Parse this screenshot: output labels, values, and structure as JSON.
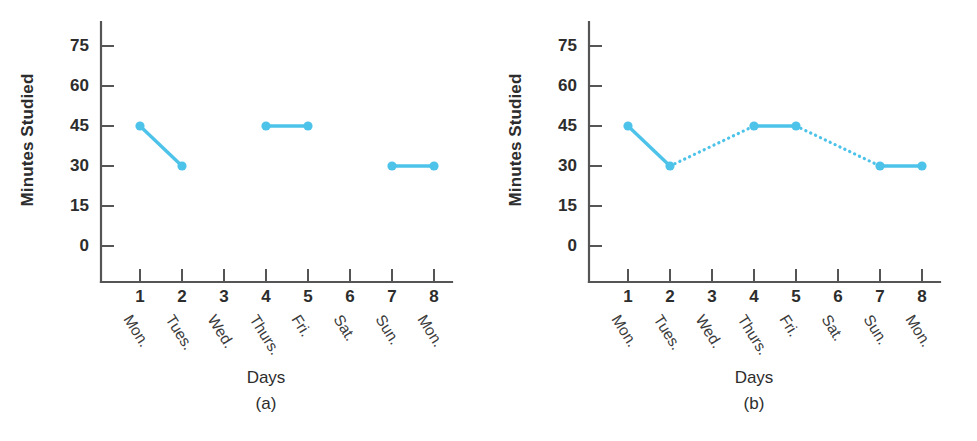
{
  "figure": {
    "panels": [
      {
        "id": "a",
        "caption": "(a)",
        "xlabel": "Days",
        "ylabel": "Minutes Studied"
      },
      {
        "id": "b",
        "caption": "(b)",
        "xlabel": "Days",
        "ylabel": "Minutes Studied"
      }
    ],
    "footer_partial_text": ""
  },
  "colors": {
    "series": "#4ec3ea",
    "marker": "#4ec3ea",
    "axis": "#555555",
    "text": "#2d2d2d"
  },
  "chart_data": [
    {
      "type": "line",
      "title": "(a)",
      "xlabel": "Days",
      "ylabel": "Minutes Studied",
      "xlim": [
        0,
        9
      ],
      "ylim": [
        0,
        80
      ],
      "grid": false,
      "legend": "none",
      "xtick_values": [
        1,
        2,
        3,
        4,
        5,
        6,
        7,
        8
      ],
      "xtick_labels": [
        "1",
        "2",
        "3",
        "4",
        "5",
        "6",
        "7",
        "8"
      ],
      "xcategory_labels": [
        "Mon.",
        "Tues.",
        "Wed.",
        "Thurs.",
        "Fri.",
        "Sat.",
        "Sun.",
        "Mon."
      ],
      "ytick_values": [
        0,
        15,
        30,
        45,
        60,
        75
      ],
      "ytick_labels": [
        "0",
        "15",
        "30",
        "45",
        "60",
        "75"
      ],
      "x": [
        1,
        2,
        4,
        5,
        7,
        8
      ],
      "values": [
        45,
        30,
        45,
        45,
        30,
        30
      ],
      "points": [
        {
          "x": 1,
          "day": "Mon.",
          "y": 45
        },
        {
          "x": 2,
          "day": "Tues.",
          "y": 30
        },
        {
          "x": 4,
          "day": "Thurs.",
          "y": 45
        },
        {
          "x": 5,
          "day": "Fri.",
          "y": 45
        },
        {
          "x": 7,
          "day": "Sun.",
          "y": 30
        },
        {
          "x": 8,
          "day": "Mon.",
          "y": 30
        }
      ],
      "segments": [
        {
          "style": "solid",
          "from": {
            "x": 1,
            "y": 45
          },
          "to": {
            "x": 2,
            "y": 30
          }
        },
        {
          "style": "solid",
          "from": {
            "x": 4,
            "y": 45
          },
          "to": {
            "x": 5,
            "y": 45
          }
        },
        {
          "style": "solid",
          "from": {
            "x": 7,
            "y": 30
          },
          "to": {
            "x": 8,
            "y": 30
          }
        }
      ],
      "missing_x": [
        3,
        6
      ],
      "notes": "Only measured days plotted; gaps left blank at days 3 and 6."
    },
    {
      "type": "line",
      "title": "(b)",
      "xlabel": "Days",
      "ylabel": "Minutes Studied",
      "xlim": [
        0,
        9
      ],
      "ylim": [
        0,
        80
      ],
      "grid": false,
      "legend": "none",
      "xtick_values": [
        1,
        2,
        3,
        4,
        5,
        6,
        7,
        8
      ],
      "xtick_labels": [
        "1",
        "2",
        "3",
        "4",
        "5",
        "6",
        "7",
        "8"
      ],
      "xcategory_labels": [
        "Mon.",
        "Tues.",
        "Wed.",
        "Thurs.",
        "Fri.",
        "Sat.",
        "Sun.",
        "Mon."
      ],
      "ytick_values": [
        0,
        15,
        30,
        45,
        60,
        75
      ],
      "ytick_labels": [
        "0",
        "15",
        "30",
        "45",
        "60",
        "75"
      ],
      "x": [
        1,
        2,
        4,
        5,
        7,
        8
      ],
      "values": [
        45,
        30,
        45,
        45,
        30,
        30
      ],
      "points": [
        {
          "x": 1,
          "day": "Mon.",
          "y": 45
        },
        {
          "x": 2,
          "day": "Tues.",
          "y": 30
        },
        {
          "x": 4,
          "day": "Thurs.",
          "y": 45
        },
        {
          "x": 5,
          "day": "Fri.",
          "y": 45
        },
        {
          "x": 7,
          "day": "Sun.",
          "y": 30
        },
        {
          "x": 8,
          "day": "Mon.",
          "y": 30
        }
      ],
      "segments": [
        {
          "style": "solid",
          "from": {
            "x": 1,
            "y": 45
          },
          "to": {
            "x": 2,
            "y": 30
          }
        },
        {
          "style": "dotted",
          "from": {
            "x": 2,
            "y": 30
          },
          "to": {
            "x": 4,
            "y": 45
          }
        },
        {
          "style": "solid",
          "from": {
            "x": 4,
            "y": 45
          },
          "to": {
            "x": 5,
            "y": 45
          }
        },
        {
          "style": "dotted",
          "from": {
            "x": 5,
            "y": 45
          },
          "to": {
            "x": 7,
            "y": 30
          }
        },
        {
          "style": "solid",
          "from": {
            "x": 7,
            "y": 30
          },
          "to": {
            "x": 8,
            "y": 30
          }
        }
      ],
      "missing_x": [
        3,
        6
      ],
      "notes": "Gaps at days 3 and 6 are bridged with dotted interpolation lines."
    }
  ]
}
